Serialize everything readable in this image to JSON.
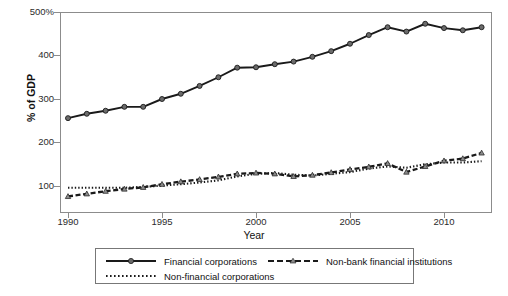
{
  "chart_data": {
    "type": "line",
    "title": "",
    "subtitle": "",
    "xlabel": "Year",
    "ylabel": "% of GDP",
    "xlim": [
      1990,
      2012
    ],
    "ylim": [
      60,
      510
    ],
    "grid": false,
    "legend_position": "bottom",
    "x": [
      1990,
      1991,
      1992,
      1993,
      1994,
      1995,
      1996,
      1997,
      1998,
      1999,
      2000,
      2001,
      2002,
      2003,
      2004,
      2005,
      2006,
      2007,
      2008,
      2009,
      2010,
      2011,
      2012
    ],
    "xticks": [
      1990,
      1995,
      2000,
      2005,
      2010
    ],
    "xticklabels": [
      "1990",
      "1995",
      "2000",
      "2005",
      "2010"
    ],
    "yticks": [
      100,
      200,
      300,
      400,
      500
    ],
    "yticklabels": [
      "100",
      "200",
      "300",
      "400",
      "500%"
    ],
    "series": [
      {
        "name": "Financial corporations",
        "style": "solid",
        "color": "#1a1a1a",
        "marker": "circle",
        "marker_color": "#6b6b6b",
        "values": [
          256,
          266,
          273,
          282,
          282,
          300,
          312,
          330,
          350,
          372,
          373,
          380,
          386,
          397,
          410,
          427,
          447,
          465,
          455,
          473,
          463,
          458,
          465
        ]
      },
      {
        "name": "Non-financial corporations",
        "style": "dotted",
        "color": "#1a1a1a",
        "marker": "none",
        "marker_color": "#1a1a1a",
        "values": [
          96,
          96,
          96,
          96,
          98,
          101,
          104,
          108,
          113,
          122,
          128,
          130,
          126,
          124,
          128,
          132,
          140,
          145,
          142,
          150,
          154,
          154,
          157
        ]
      },
      {
        "name": "Non-bank financial institutions",
        "style": "dashed",
        "color": "#1a1a1a",
        "marker": "triangle",
        "marker_color": "#8c8c8c",
        "values": [
          76,
          82,
          88,
          93,
          97,
          104,
          110,
          115,
          121,
          128,
          130,
          128,
          122,
          125,
          131,
          138,
          144,
          152,
          132,
          145,
          158,
          163,
          176
        ]
      }
    ]
  },
  "legend": {
    "entries": [
      {
        "label": "Financial corporations"
      },
      {
        "label": "Non-financial corporations"
      },
      {
        "label": "Non-bank financial institutions"
      }
    ]
  }
}
